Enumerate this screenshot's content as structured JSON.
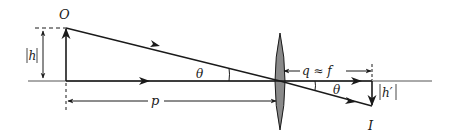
{
  "diagram": {
    "type": "thin-lens ray diagram",
    "labels": {
      "object": "O",
      "image": "I",
      "object_height": "|h|",
      "image_height": "|h′|",
      "object_distance": "p",
      "image_distance": "q ≈ f",
      "angle_upper": "θ",
      "angle_lower": "θ"
    },
    "colors": {
      "line": "#1a1a1a",
      "lens_fill": "#8a8a8a",
      "axis": "#555555"
    }
  }
}
